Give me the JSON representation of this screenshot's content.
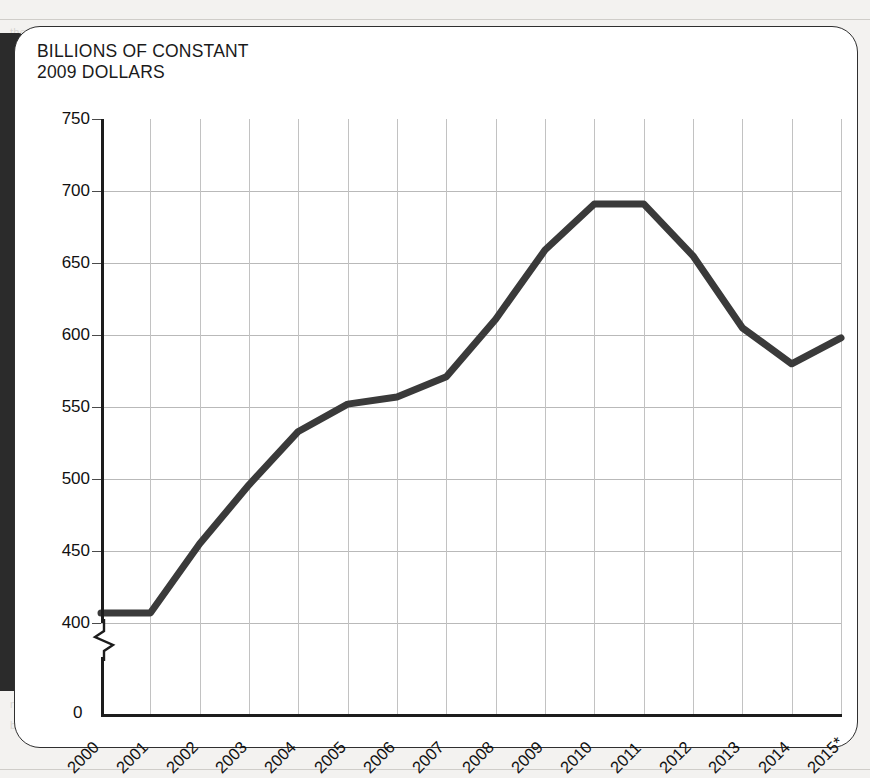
{
  "chart_data": {
    "type": "line",
    "title": "BILLIONS OF CONSTANT\n2009 DOLLARS",
    "xlabel": "",
    "ylabel": "",
    "categories": [
      "2000",
      "2001",
      "2002",
      "2003",
      "2004",
      "2005",
      "2006",
      "2007",
      "2008",
      "2009",
      "2010",
      "2011",
      "2012",
      "2013",
      "2014",
      "2015*"
    ],
    "values": [
      407,
      407,
      455,
      496,
      533,
      552,
      557,
      571,
      611,
      659,
      691,
      691,
      655,
      605,
      580,
      598
    ],
    "series": [
      {
        "name": "Defense spending",
        "values": [
          407,
          407,
          455,
          496,
          533,
          552,
          557,
          571,
          611,
          659,
          691,
          691,
          655,
          605,
          580,
          598
        ]
      }
    ],
    "ylim": [
      400,
      750
    ],
    "yticks": [
      400,
      450,
      500,
      550,
      600,
      650,
      700,
      750
    ],
    "ytick_labels": [
      "400",
      "450",
      "500",
      "550",
      "600",
      "650",
      "700",
      "750"
    ],
    "zero_label": "0",
    "axis_break": true,
    "grid": true,
    "legend": "none",
    "line_color": "#3a3a3a",
    "grid_color": "#bdbdbd",
    "axis_color": "#1c1c1c"
  },
  "callout": {
    "accent_color": "#2b2b2b",
    "border_color": "#2f2f2f"
  },
  "background_text": [
    "the defense budget",
    "in constant dollars",
    "spending levels",
    "over the period",
    "projected outlays",
    "national defense",
    "appropriations",
    "discretionary",
    "base budget",
    "war funding",
    "fiscal year",
    "the Pentagon",
    "total request"
  ]
}
